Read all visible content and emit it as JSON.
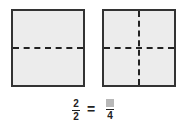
{
  "figure": {
    "left_square": {
      "divisions": 2,
      "orientation": "horizontal"
    },
    "right_square": {
      "divisions": 4,
      "orientation": "horizontal-and-vertical"
    }
  },
  "equation": {
    "left_numerator": "2",
    "left_denominator": "2",
    "equals": "=",
    "right_numerator_blank": "",
    "right_denominator": "4"
  },
  "colors": {
    "fill": "#ececec",
    "stroke": "#333333",
    "blank_box": "#b8b8b8"
  }
}
